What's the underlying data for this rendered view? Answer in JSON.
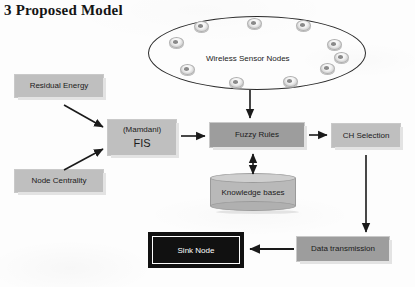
{
  "figure": {
    "title": "3 Proposed Model"
  },
  "cloud": {
    "label": "Wireless Sensor Nodes",
    "node_icon": "sensor-node-icon",
    "node_count": 10
  },
  "boxes": {
    "residual_energy": {
      "label": "Residual Energy",
      "fill": "#bfbfbf"
    },
    "node_centrality": {
      "label": "Node Centrality",
      "fill": "#bfbfbf"
    },
    "fis_line1": "(Mamdani)",
    "fis_line2": "FIS",
    "fis": {
      "fill": "#bfbfbf"
    },
    "fuzzy_rules": {
      "label": "Fuzzy Rules",
      "fill": "#9d9d9d"
    },
    "ch_selection": {
      "label": "CH  Selection",
      "fill": "#bfbfbf"
    },
    "knowledge_bases": {
      "label": "Knowledge bases",
      "fill": "#b9b9b9"
    },
    "data_transmission": {
      "label": "Data transmission",
      "fill": "#9d9d9d"
    },
    "sink_node": {
      "label": "Sink Node",
      "fill": "#111111",
      "text_color": "#ffffff"
    }
  },
  "connectors": [
    {
      "name": "residual-energy-to-fis",
      "style": "diagonal-arrow"
    },
    {
      "name": "node-centrality-to-fis",
      "style": "diagonal-arrow"
    },
    {
      "name": "fis-to-fuzzy-rules",
      "style": "horizontal-arrow"
    },
    {
      "name": "sensor-nodes-to-fuzzy-rules",
      "style": "vertical-arrow"
    },
    {
      "name": "fuzzy-rules-to-knowledge-bases",
      "style": "double-arrow"
    },
    {
      "name": "fuzzy-rules-to-ch-selection",
      "style": "horizontal-arrow"
    },
    {
      "name": "ch-selection-to-data-transmission",
      "style": "vertical-arrow"
    },
    {
      "name": "data-transmission-to-sink-node",
      "style": "horizontal-arrow"
    }
  ],
  "colors": {
    "page_background": "#fdfdfd",
    "outline": "#2a2a2a",
    "light_gray": "#bfbfbf",
    "mid_gray": "#9d9d9d",
    "black": "#111111"
  }
}
